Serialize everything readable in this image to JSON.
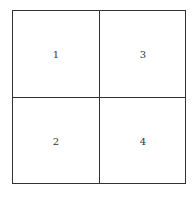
{
  "diagram": {
    "type": "2x2-grid",
    "cells": [
      {
        "position": "top-left",
        "label": "1"
      },
      {
        "position": "bottom-left",
        "label": "2"
      },
      {
        "position": "top-right",
        "label": "3"
      },
      {
        "position": "bottom-right",
        "label": "4"
      }
    ]
  },
  "colors": {
    "line": "#333333",
    "background": "#ffffff"
  }
}
